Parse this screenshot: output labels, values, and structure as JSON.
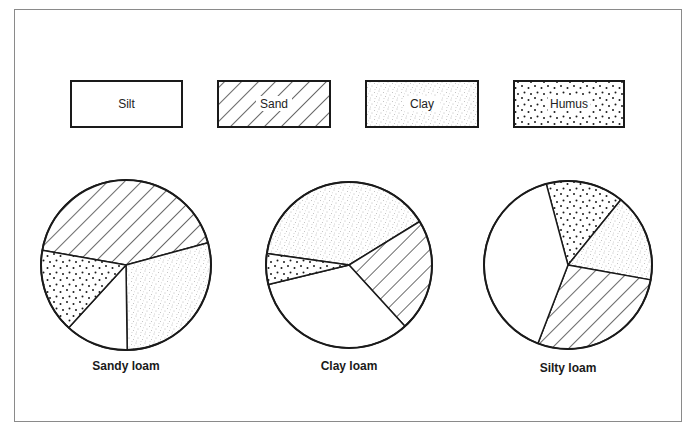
{
  "chart_data": {
    "type": "pie",
    "title": "",
    "legend": {
      "position": "top",
      "entries": [
        {
          "name": "Silt",
          "pattern": "blank"
        },
        {
          "name": "Sand",
          "pattern": "diagonal-hatch"
        },
        {
          "name": "Clay",
          "pattern": "fine-stipple"
        },
        {
          "name": "Humus",
          "pattern": "coarse-dots"
        }
      ]
    },
    "charts": [
      {
        "label": "Sandy loam",
        "slices": [
          {
            "name": "Sand",
            "percent": 43
          },
          {
            "name": "Clay",
            "percent": 29
          },
          {
            "name": "Silt",
            "percent": 12
          },
          {
            "name": "Humus",
            "percent": 16
          }
        ]
      },
      {
        "label": "Clay loam",
        "slices": [
          {
            "name": "Clay",
            "percent": 39
          },
          {
            "name": "Sand",
            "percent": 22
          },
          {
            "name": "Silt",
            "percent": 33
          },
          {
            "name": "Humus",
            "percent": 6
          }
        ]
      },
      {
        "label": "Silty loam",
        "slices": [
          {
            "name": "Humus",
            "percent": 15
          },
          {
            "name": "Clay",
            "percent": 17
          },
          {
            "name": "Sand",
            "percent": 28
          },
          {
            "name": "Silt",
            "percent": 40
          }
        ]
      }
    ]
  },
  "layout": {
    "legend_boxes": [
      {
        "x": 71,
        "y": 81,
        "w": 111,
        "h": 46
      },
      {
        "x": 218,
        "y": 81,
        "w": 112,
        "h": 46
      },
      {
        "x": 366,
        "y": 81,
        "w": 112,
        "h": 46
      },
      {
        "x": 514,
        "y": 81,
        "w": 110,
        "h": 46
      }
    ],
    "pies": [
      {
        "cx": 126,
        "cy": 265,
        "r": 85,
        "start_deg": 280,
        "label_y": 370
      },
      {
        "cx": 349,
        "cy": 265,
        "r": 83,
        "start_deg": 278,
        "label_y": 370
      },
      {
        "cx": 568,
        "cy": 265,
        "r": 84,
        "start_deg": 345,
        "label_y": 372
      }
    ]
  }
}
